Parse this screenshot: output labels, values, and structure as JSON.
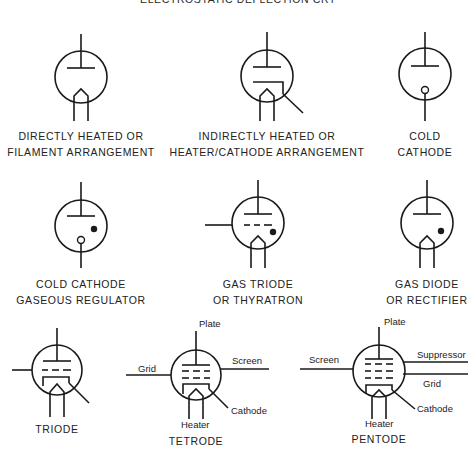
{
  "title": "ELECTROSTATIC DEFLECTION CRT",
  "symbols": [
    {
      "id": "directly-heated",
      "caption": [
        "DIRECTLY HEATED OR",
        "FILAMENT ARRANGEMENT"
      ]
    },
    {
      "id": "indirectly-heated",
      "caption": [
        "INDIRECTLY HEATED OR",
        "HEATER/CATHODE ARRANGEMENT"
      ]
    },
    {
      "id": "cold-cathode",
      "caption": [
        "COLD",
        "CATHODE"
      ]
    },
    {
      "id": "cold-cathode-gaseous-regulator",
      "caption": [
        "COLD CATHODE",
        "GASEOUS REGULATOR"
      ]
    },
    {
      "id": "gas-triode",
      "caption": [
        "GAS TRIODE",
        "OR THYRATRON"
      ]
    },
    {
      "id": "gas-diode",
      "caption": [
        "GAS DIODE",
        "OR RECTIFIER"
      ]
    },
    {
      "id": "triode",
      "caption": [
        "TRIODE"
      ]
    },
    {
      "id": "tetrode",
      "caption": [
        "TETRODE"
      ],
      "labels": {
        "plate": "Plate",
        "grid": "Grid",
        "screen": "Screen",
        "heater": "Heater",
        "cathode": "Cathode"
      }
    },
    {
      "id": "pentode",
      "caption": [
        "PENTODE"
      ],
      "labels": {
        "plate": "Plate",
        "screen": "Screen",
        "suppressor": "Suppressor",
        "grid": "Grid",
        "heater": "Heater",
        "cathode": "Cathode"
      }
    }
  ]
}
